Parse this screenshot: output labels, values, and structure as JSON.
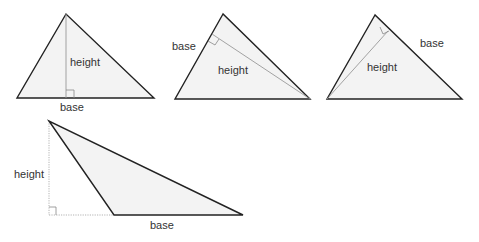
{
  "diagram": {
    "colors": {
      "fill": "#f3f3f3",
      "edge": "#222222",
      "altitude": "#999999",
      "text": "#333333"
    },
    "triangles": [
      {
        "id": "triangle-1",
        "vertices": [
          [
            66,
            14
          ],
          [
            17,
            98
          ],
          [
            154,
            98
          ]
        ],
        "height_label": "height",
        "base_label": "base",
        "note": "altitude from apex perpendicular to bottom side"
      },
      {
        "id": "triangle-2",
        "vertices": [
          [
            223,
            14
          ],
          [
            175,
            99
          ],
          [
            310,
            99
          ]
        ],
        "height_label": "height",
        "base_label": "base",
        "note": "altitude from bottom-right vertex perpendicular to left side"
      },
      {
        "id": "triangle-3",
        "vertices": [
          [
            375,
            15
          ],
          [
            327,
            99
          ],
          [
            462,
            99
          ]
        ],
        "height_label": "height",
        "base_label": "base",
        "note": "altitude from bottom-left vertex perpendicular to right side"
      },
      {
        "id": "triangle-4",
        "vertices": [
          [
            49,
            121
          ],
          [
            114,
            215
          ],
          [
            243,
            215
          ]
        ],
        "height_label": "height",
        "base_label": "base",
        "note": "obtuse triangle; altitude falls outside, base extended with dotted line"
      }
    ]
  }
}
